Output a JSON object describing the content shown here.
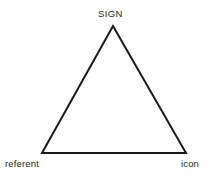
{
  "diagram": {
    "kind": "semiotic-triangle",
    "background_color": "#ffffff",
    "stroke_color": "#1a1a1a",
    "stroke_width": 2,
    "text_color": "#231f20",
    "vertices": {
      "apex": {
        "label": "SIGN",
        "x": 113,
        "y": 26
      },
      "bottom_left": {
        "label": "referent",
        "x": 42,
        "y": 153
      },
      "bottom_right": {
        "label": "icon",
        "x": 186,
        "y": 153
      }
    },
    "edges": [
      {
        "from": "bottom_left",
        "to": "apex"
      },
      {
        "from": "apex",
        "to": "bottom_right"
      },
      {
        "from": "bottom_right",
        "to": "bottom_left"
      }
    ],
    "polygon_points": "42,153 113,26 186,153"
  }
}
